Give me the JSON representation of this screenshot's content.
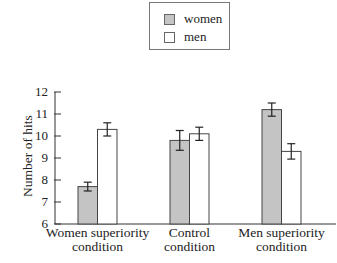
{
  "chart_data": {
    "type": "bar",
    "title": "",
    "xlabel": "",
    "ylabel": "Number of hits",
    "ylim": [
      6,
      12
    ],
    "yticks": [
      6,
      7,
      8,
      9,
      10,
      11,
      12
    ],
    "grid": false,
    "legend_position": "top-center",
    "categories": [
      "Women superiority condition",
      "Control condition",
      "Men superiority condition"
    ],
    "category_lines": [
      [
        "Women superiority",
        "condition"
      ],
      [
        "Control",
        "condition"
      ],
      [
        "Men superiority",
        "condition"
      ]
    ],
    "series": [
      {
        "name": "women",
        "color": "#c4c4c4",
        "values": [
          7.7,
          9.8,
          11.2
        ],
        "error": [
          0.2,
          0.45,
          0.3
        ]
      },
      {
        "name": "men",
        "color": "#ffffff",
        "values": [
          10.3,
          10.1,
          9.3
        ],
        "error": [
          0.3,
          0.3,
          0.35
        ]
      }
    ]
  },
  "legend": {
    "items": [
      {
        "label": "women",
        "color": "#c4c4c4"
      },
      {
        "label": "men",
        "color": "#ffffff"
      }
    ]
  }
}
